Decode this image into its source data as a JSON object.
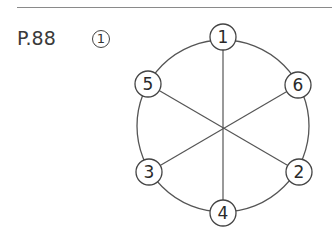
{
  "header": {
    "page_ref": "P.88",
    "question_number": "1"
  },
  "diagram": {
    "type": "circular-graph",
    "hub": {
      "x": 223,
      "y": 128
    },
    "outer_circle": {
      "cx": 223,
      "cy": 126,
      "r": 86
    },
    "nodes": [
      {
        "id": "1",
        "label": "1",
        "x": 223,
        "y": 37
      },
      {
        "id": "6",
        "label": "6",
        "x": 298,
        "y": 85
      },
      {
        "id": "2",
        "label": "2",
        "x": 299,
        "y": 172
      },
      {
        "id": "4",
        "label": "4",
        "x": 223,
        "y": 213
      },
      {
        "id": "3",
        "label": "3",
        "x": 149,
        "y": 172
      },
      {
        "id": "5",
        "label": "5",
        "x": 148,
        "y": 84
      }
    ],
    "spokes": [
      [
        "1",
        "4"
      ],
      [
        "5",
        "2"
      ],
      [
        "6",
        "3"
      ]
    ],
    "colors": {
      "line": "#555555",
      "node_stroke": "#444444",
      "text": "#2a2a2a"
    }
  }
}
